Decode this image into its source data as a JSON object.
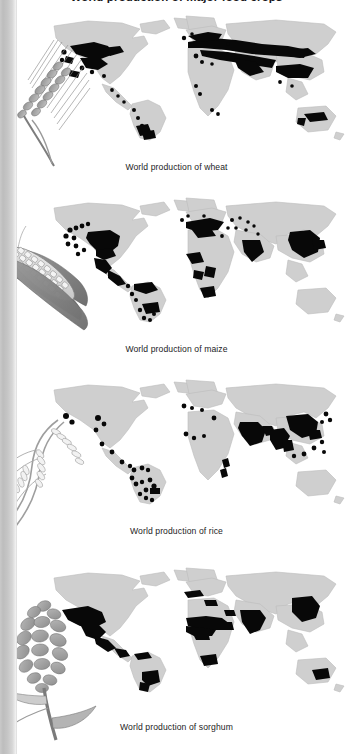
{
  "figure": {
    "title": "World production of major food crops",
    "background_color": "#ffffff",
    "land_color": "#cfcfcf",
    "production_color": "#080808",
    "gutter_color": "#c3c3c3"
  },
  "panels": [
    {
      "id": "wheat",
      "caption": "World production of wheat",
      "plant_icon": "wheat-ear-illustration",
      "crop": "wheat",
      "map_type": "world-dot-distribution",
      "production_regions": [
        "Canadian Prairies",
        "United States Great Plains",
        "Mexico (small)",
        "Argentina Pampas",
        "Chile",
        "Brazil (south)",
        "Western Europe",
        "Eastern Europe",
        "Ukraine and Russian steppe",
        "Turkey",
        "Iran",
        "Kazakhstan",
        "Northern India and Pakistan",
        "Northern China",
        "Australia (southeast and southwest)",
        "North Africa (Morocco, Algeria, Tunisia, Egypt)",
        "Ethiopia",
        "South Africa"
      ]
    },
    {
      "id": "maize",
      "caption": "World production of maize",
      "plant_icon": "maize-ear-illustration",
      "crop": "maize",
      "map_type": "world-dot-distribution",
      "production_regions": [
        "United States Corn Belt",
        "Mexico",
        "Central America",
        "Venezuela and Colombia",
        "Brazil (south)",
        "Argentina",
        "France and Balkans",
        "Romania and Ukraine",
        "Russia (south)",
        "Northern India",
        "Northeast China",
        "West Africa",
        "Kenya and Tanzania",
        "Southern Africa"
      ]
    },
    {
      "id": "rice",
      "caption": "World production of rice",
      "plant_icon": "rice-panicle-illustration",
      "crop": "rice",
      "map_type": "world-dot-distribution",
      "production_regions": [
        "United States (Mississippi delta and California)",
        "Central America",
        "Brazil",
        "Colombia and Peru",
        "Guyana",
        "Italy and Spain",
        "Egypt",
        "West Africa",
        "Madagascar",
        "India",
        "Bangladesh",
        "Myanmar",
        "Thailand",
        "Vietnam",
        "Southern China",
        "Indonesia",
        "Philippines",
        "Japan and Korea"
      ]
    },
    {
      "id": "sorghum",
      "caption": "World production of sorghum",
      "plant_icon": "sorghum-panicle-illustration",
      "crop": "sorghum",
      "map_type": "world-dot-distribution",
      "production_regions": [
        "United States Great Plains (south)",
        "Mexico",
        "Central America",
        "Venezuela",
        "Argentina",
        "Brazil",
        "Sahel belt (Mali to Sudan)",
        "Nigeria",
        "Ethiopia",
        "Southern Africa",
        "India (Deccan)",
        "Yemen",
        "Northern China",
        "Australia (Queensland)"
      ]
    }
  ]
}
